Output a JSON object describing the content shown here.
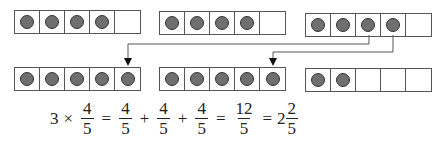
{
  "figure": {
    "counter_color": "#6f6f6f",
    "line_color": "#555555",
    "top_row": [
      {
        "cells": 5,
        "filled": 4
      },
      {
        "cells": 5,
        "filled": 4
      },
      {
        "cells": 5,
        "filled": 4
      }
    ],
    "bottom_row": [
      {
        "cells": 5,
        "filled": 5
      },
      {
        "cells": 5,
        "filled": 5
      },
      {
        "cells": 5,
        "filled": 2
      }
    ],
    "arrows": [
      {
        "from": "top strip 3, counter 3",
        "to": "bottom strip 1, cell 5"
      },
      {
        "from": "top strip 3, counter 4",
        "to": "bottom strip 2, cell 5"
      }
    ]
  },
  "equation": {
    "factor": "3",
    "times": "×",
    "eq": "=",
    "plus": "+",
    "terms": [
      {
        "num": "4",
        "den": "5"
      },
      {
        "num": "4",
        "den": "5"
      },
      {
        "num": "4",
        "den": "5"
      },
      {
        "num": "4",
        "den": "5"
      }
    ],
    "sum": {
      "num": "12",
      "den": "5"
    },
    "mixed": {
      "whole": "2",
      "num": "2",
      "den": "5"
    }
  }
}
